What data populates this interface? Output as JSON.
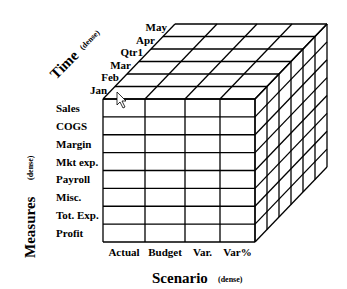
{
  "diagram": {
    "type": "olap-cube",
    "axes": {
      "time": {
        "title": "Time",
        "qualifier": "(dense)",
        "members": [
          "Jan",
          "Feb",
          "Mar",
          "Qtr1",
          "Apr",
          "May"
        ]
      },
      "measures": {
        "title": "Measures",
        "qualifier": "(dense)",
        "members": [
          "Sales",
          "COGS",
          "Margin",
          "Mkt exp.",
          "Payroll",
          "Misc.",
          "Tot. Exp.",
          "Profit"
        ]
      },
      "scenario": {
        "title": "Scenario",
        "qualifier": "(dense)",
        "members": [
          "Actual",
          "Budget",
          "Var.",
          "Var%"
        ]
      }
    },
    "geometry": {
      "front_left": 103,
      "front_top": 99,
      "front_bottom": 242,
      "column_x": [
        103,
        145,
        185,
        220,
        255
      ],
      "depth_dx": 12,
      "depth_dy": -12.5
    },
    "cursor": {
      "x": 117,
      "y": 92
    },
    "colors": {
      "line": "#000000",
      "background": "#ffffff"
    }
  }
}
